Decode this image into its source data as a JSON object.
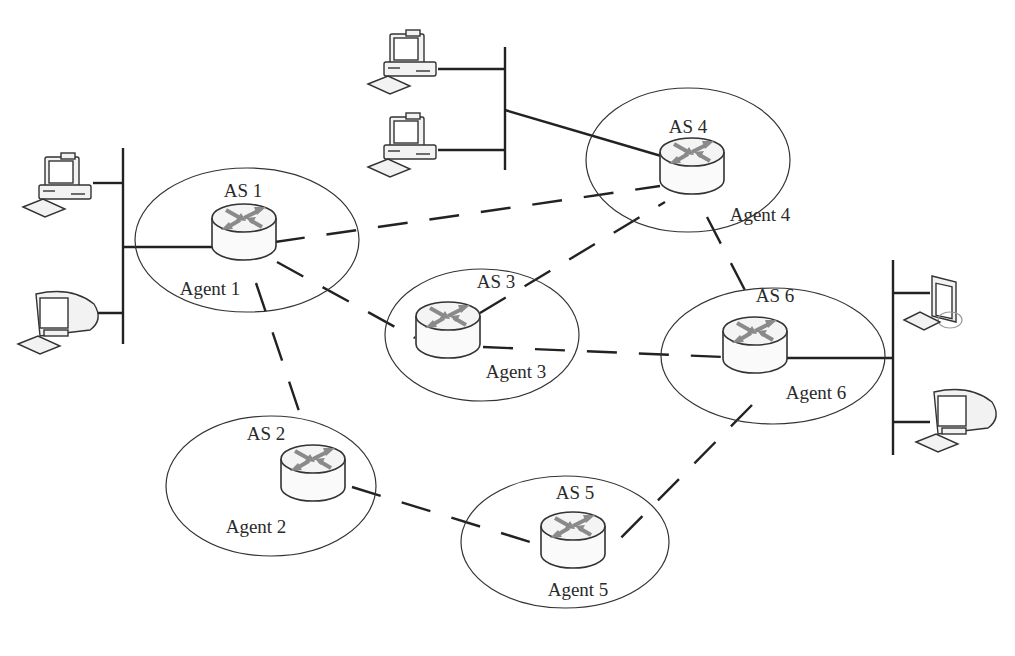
{
  "diagram": {
    "colors": {
      "line": "#222222",
      "ellipse": "#333333",
      "router_arrow": "#8a8a8a",
      "background": "#ffffff"
    },
    "autonomous_systems": [
      {
        "id": "as1",
        "label": "AS 1",
        "agent_label": "Agent 1",
        "cx": 247,
        "cy": 240,
        "rx": 112,
        "ry": 72,
        "router": {
          "x": 244,
          "y": 232
        },
        "label_pos": {
          "x": 243,
          "y": 197
        },
        "agent_pos": {
          "x": 210,
          "y": 295
        }
      },
      {
        "id": "as2",
        "label": "AS 2",
        "agent_label": "Agent 2",
        "cx": 271,
        "cy": 486,
        "rx": 105,
        "ry": 70,
        "router": {
          "x": 313,
          "y": 473
        },
        "label_pos": {
          "x": 266,
          "y": 440
        },
        "agent_pos": {
          "x": 256,
          "y": 533
        }
      },
      {
        "id": "as3",
        "label": "AS 3",
        "agent_label": "Agent 3",
        "cx": 482,
        "cy": 335,
        "rx": 97,
        "ry": 66,
        "router": {
          "x": 448,
          "y": 330
        },
        "label_pos": {
          "x": 496,
          "y": 288
        },
        "agent_pos": {
          "x": 516,
          "y": 378
        }
      },
      {
        "id": "as4",
        "label": "AS 4",
        "agent_label": "Agent 4",
        "cx": 688,
        "cy": 160,
        "rx": 102,
        "ry": 72,
        "router": {
          "x": 692,
          "y": 166
        },
        "label_pos": {
          "x": 688,
          "y": 133
        },
        "agent_pos": {
          "x": 760,
          "y": 221
        }
      },
      {
        "id": "as5",
        "label": "AS 5",
        "agent_label": "Agent 5",
        "cx": 565,
        "cy": 542,
        "rx": 104,
        "ry": 66,
        "router": {
          "x": 573,
          "y": 540
        },
        "label_pos": {
          "x": 575,
          "y": 499
        },
        "agent_pos": {
          "x": 578,
          "y": 596
        }
      },
      {
        "id": "as6",
        "label": "AS 6",
        "agent_label": "Agent 6",
        "cx": 773,
        "cy": 356,
        "rx": 112,
        "ry": 68,
        "router": {
          "x": 755,
          "y": 345
        },
        "label_pos": {
          "x": 775,
          "y": 302
        },
        "agent_pos": {
          "x": 816,
          "y": 399
        }
      }
    ],
    "links": [
      {
        "from": "as1",
        "to": "as4",
        "style": "dashed",
        "x1": 275,
        "y1": 242,
        "x2": 660,
        "y2": 186
      },
      {
        "from": "as1",
        "to": "as3",
        "style": "dashed",
        "x1": 277,
        "y1": 262,
        "x2": 415,
        "y2": 338
      },
      {
        "from": "as1",
        "to": "as2",
        "style": "dashed",
        "x1": 256,
        "y1": 283,
        "x2": 302,
        "y2": 420
      },
      {
        "from": "as3",
        "to": "as4",
        "style": "dashed",
        "x1": 480,
        "y1": 313,
        "x2": 665,
        "y2": 202
      },
      {
        "from": "as3",
        "to": "as6",
        "style": "dashed",
        "x1": 483,
        "y1": 347,
        "x2": 725,
        "y2": 357
      },
      {
        "from": "as4",
        "to": "as6",
        "style": "dashed",
        "x1": 707,
        "y1": 217,
        "x2": 750,
        "y2": 300
      },
      {
        "from": "as6",
        "to": "as5",
        "style": "dashed",
        "x1": 752,
        "y1": 405,
        "x2": 607,
        "y2": 552
      },
      {
        "from": "as2",
        "to": "as5",
        "style": "dashed",
        "x1": 352,
        "y1": 487,
        "x2": 540,
        "y2": 545
      }
    ],
    "lan_segments": [
      {
        "id": "lan-left",
        "bus": {
          "x": 123,
          "y1": 148,
          "y2": 344
        },
        "uplink": {
          "x1": 123,
          "y1": 247,
          "x2": 212,
          "y2": 247
        },
        "hosts": [
          {
            "type": "desktop",
            "x": 35,
            "y": 155,
            "join_y": 183
          },
          {
            "type": "crt",
            "x": 32,
            "y": 290,
            "join_y": 313
          }
        ]
      },
      {
        "id": "lan-top",
        "bus": {
          "x": 505,
          "y1": 47,
          "y2": 170
        },
        "uplink": {
          "x1": 505,
          "y1": 110,
          "x2": 668,
          "y2": 158
        },
        "hosts": [
          {
            "type": "desktop",
            "x": 380,
            "y": 32,
            "join_y": 69
          },
          {
            "type": "desktop",
            "x": 380,
            "y": 115,
            "join_y": 150
          }
        ]
      },
      {
        "id": "lan-right",
        "bus": {
          "x": 893,
          "y1": 260,
          "y2": 455
        },
        "uplink": {
          "x1": 784,
          "y1": 358,
          "x2": 893,
          "y2": 358
        },
        "hosts": [
          {
            "type": "flat",
            "x": 930,
            "y": 276,
            "join_y": 293
          },
          {
            "type": "crt",
            "x": 930,
            "y": 388,
            "join_y": 422
          }
        ]
      }
    ]
  }
}
